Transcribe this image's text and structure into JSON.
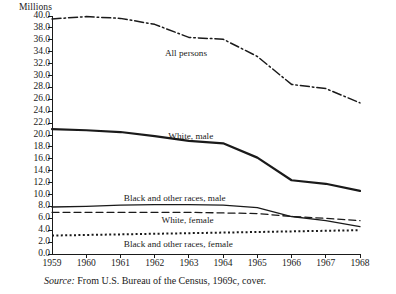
{
  "chart_data": {
    "type": "line",
    "title": "",
    "subtitle": "",
    "xlabel": "",
    "ylabel": "Millions",
    "units_label": "Millions",
    "x": [
      1959,
      1960,
      1961,
      1962,
      1963,
      1964,
      1965,
      1966,
      1967,
      1968
    ],
    "xtick_labels": [
      "1959",
      "1960",
      "1961",
      "1962",
      "1963",
      "1964",
      "1965",
      "1966",
      "1967",
      "1968"
    ],
    "xlim": [
      1959,
      1968
    ],
    "ylim": [
      0.0,
      40.0
    ],
    "ytick_labels": [
      "0.0",
      "2.0",
      "4.0",
      "6.0",
      "8.0",
      "10.0",
      "12.0",
      "14.0",
      "16.0",
      "18.0",
      "20.0",
      "22.0",
      "24.0",
      "26.0",
      "28.0",
      "30.0",
      "32.0",
      "34.0",
      "36.0",
      "38.0",
      "40.0"
    ],
    "ytick_values": [
      0.0,
      2.0,
      4.0,
      6.0,
      8.0,
      10.0,
      12.0,
      14.0,
      16.0,
      18.0,
      20.0,
      22.0,
      24.0,
      26.0,
      28.0,
      30.0,
      32.0,
      34.0,
      36.0,
      38.0,
      40.0
    ],
    "grid": false,
    "legend": "inline-labels",
    "line_color": "#1a1a1a",
    "series": [
      {
        "name": "All persons",
        "style": "dash-dot",
        "label_x": 1962.3,
        "label_y": 33.6,
        "values": [
          39.5,
          39.9,
          39.6,
          38.6,
          36.4,
          36.1,
          33.2,
          28.5,
          27.8,
          25.4
        ]
      },
      {
        "name": "White, male",
        "style": "solid-thick",
        "label_x": 1962.4,
        "label_y": 19.7,
        "values": [
          21.0,
          20.8,
          20.5,
          19.8,
          19.0,
          18.6,
          16.2,
          12.4,
          11.8,
          10.6
        ]
      },
      {
        "name": "Black and other races, male",
        "style": "solid-thin",
        "label_x": 1961.1,
        "label_y": 9.3,
        "values": [
          7.9,
          8.0,
          8.2,
          8.3,
          8.3,
          8.2,
          7.8,
          6.3,
          5.6,
          4.6
        ]
      },
      {
        "name": "White, female",
        "style": "dashed",
        "label_x": 1962.2,
        "label_y": 5.6,
        "values": [
          7.0,
          7.0,
          7.0,
          7.0,
          7.0,
          6.9,
          6.8,
          6.3,
          6.0,
          5.6
        ]
      },
      {
        "name": "Black and other races, female",
        "style": "dotted",
        "label_x": 1961.1,
        "label_y": 1.5,
        "values": [
          3.1,
          3.2,
          3.3,
          3.4,
          3.5,
          3.6,
          3.7,
          3.8,
          3.9,
          4.0
        ]
      }
    ]
  },
  "source": {
    "prefix": "Source:",
    "text": "From U.S. Bureau of the Census, 1969c, cover."
  }
}
